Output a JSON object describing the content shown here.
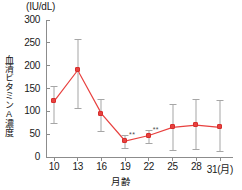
{
  "chart_data": {
    "type": "line",
    "title": "",
    "unit_label": "(IU/dL)",
    "ylabel": "血清ビタミンA濃度",
    "xlabel": "月齢",
    "x_unit_suffix": "(月)",
    "categories": [
      "10",
      "13",
      "16",
      "19",
      "22",
      "25",
      "28",
      "31"
    ],
    "xticklabels": [
      "10",
      "13",
      "16",
      "19",
      "22",
      "25",
      "28",
      "31(月)"
    ],
    "yticklabels": [
      "0",
      "50",
      "100",
      "150",
      "200",
      "250",
      "300"
    ],
    "ytickvalues": [
      0,
      50,
      100,
      150,
      200,
      250,
      300
    ],
    "ylim": [
      0,
      300
    ],
    "grid": false,
    "legend": "none",
    "series": [
      {
        "name": "血清ビタミンA濃度",
        "color": "#e8413f",
        "errorbar_color": "#a6a6a6",
        "values": [
          122,
          190,
          95,
          35,
          47,
          65,
          70,
          65
        ],
        "err_upper": [
          155,
          258,
          126,
          48,
          60,
          115,
          127,
          125
        ],
        "err_lower": [
          75,
          108,
          57,
          20,
          30,
          15,
          18,
          14
        ]
      }
    ],
    "annotations": [
      {
        "label": "**",
        "x_index": 3,
        "value": 35
      },
      {
        "label": "**",
        "x_index": 4,
        "value": 47
      }
    ]
  }
}
